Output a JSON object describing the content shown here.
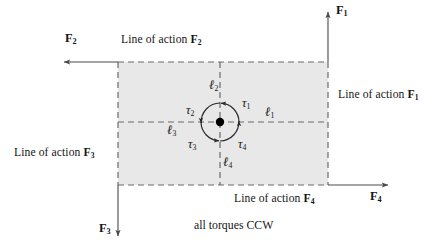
{
  "figure": {
    "caption": "all torques CCW",
    "background_color": "#ffffff",
    "body_fill": "#e8e8e8",
    "line_color": "#4a4a4a",
    "text_color": "#151515",
    "pivot_color": "#000000"
  },
  "lines_of_action": [
    {
      "id": "loa1",
      "text_prefix": "Line of action ",
      "force": "F",
      "sub": "1"
    },
    {
      "id": "loa2",
      "text_prefix": "Line of action ",
      "force": "F",
      "sub": "2"
    },
    {
      "id": "loa3",
      "text_prefix": "Line of action ",
      "force": "F",
      "sub": "3"
    },
    {
      "id": "loa4",
      "text_prefix": "Line of action ",
      "force": "F",
      "sub": "4"
    }
  ],
  "forces": [
    {
      "id": "F1",
      "symbol": "F",
      "sub": "1",
      "direction": "up"
    },
    {
      "id": "F2",
      "symbol": "F",
      "sub": "2",
      "direction": "left"
    },
    {
      "id": "F3",
      "symbol": "F",
      "sub": "3",
      "direction": "down"
    },
    {
      "id": "F4",
      "symbol": "F",
      "sub": "4",
      "direction": "right"
    }
  ],
  "torques": [
    {
      "id": "tau1",
      "symbol": "τ",
      "sub": "1",
      "sense": "CCW"
    },
    {
      "id": "tau2",
      "symbol": "τ",
      "sub": "2",
      "sense": "CCW"
    },
    {
      "id": "tau3",
      "symbol": "τ",
      "sub": "3",
      "sense": "CCW"
    },
    {
      "id": "tau4",
      "symbol": "τ",
      "sub": "4",
      "sense": "CCW"
    }
  ],
  "lever_arms": [
    {
      "id": "l1",
      "symbol": "ℓ",
      "sub": "1"
    },
    {
      "id": "l2",
      "symbol": "ℓ",
      "sub": "2"
    },
    {
      "id": "l3",
      "symbol": "ℓ",
      "sub": "3"
    },
    {
      "id": "l4",
      "symbol": "ℓ",
      "sub": "4"
    }
  ]
}
